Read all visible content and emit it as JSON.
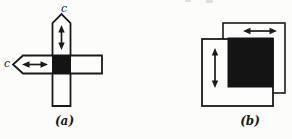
{
  "figure_type": "textbook-diagram",
  "background_color": "#fcfcfa",
  "ink_color": "#1a1a1a",
  "panel_a": {
    "caption": "(a)",
    "top_label": "c",
    "left_label": "c",
    "description": "cross of two rectangular strips with pointed ends, black square at intersection, double-headed arrows along each strip"
  },
  "panel_b": {
    "caption": "(b)",
    "description": "two overlapping outlined squares with large black filled square, horizontal and vertical double-headed arrows"
  }
}
